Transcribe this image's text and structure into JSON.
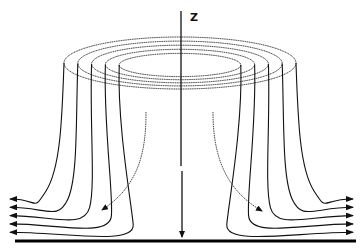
{
  "figure": {
    "axis_label": "Z",
    "ring_count": 5,
    "outer_streamline_count_per_side": 5,
    "inner_streamline_count_per_side": 1,
    "colors": {
      "line": "#111111",
      "ground": "#000000",
      "background": "#ffffff"
    }
  }
}
